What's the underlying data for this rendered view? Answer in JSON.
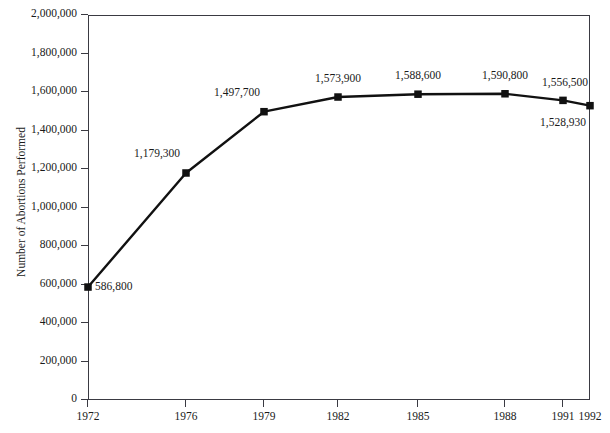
{
  "chart_data": {
    "type": "line",
    "title": "",
    "title_note": "title is cropped off the top edge of the screenshot and is unreadable",
    "xlabel": "",
    "ylabel": "Number of Abortions Performed",
    "x": [
      1972,
      1976,
      1979,
      1982,
      1985,
      1988,
      1991,
      1992
    ],
    "categories": [
      "1972",
      "1976",
      "1979",
      "1982",
      "1985",
      "1988",
      "1991",
      "1992"
    ],
    "values": [
      586800,
      1179300,
      1497700,
      1573900,
      1588600,
      1590800,
      1556500,
      1528930
    ],
    "point_labels": [
      "586,800",
      "1,179,300",
      "1,497,700",
      "1,573,900",
      "1,588,600",
      "1,590,800",
      "1,556,500",
      "1,528,930"
    ],
    "series": [
      {
        "name": "Number of Abortions Performed",
        "values": [
          586800,
          1179300,
          1497700,
          1573900,
          1588600,
          1590800,
          1556500,
          1528930
        ],
        "marker": "square",
        "color": "#111111"
      }
    ],
    "ylim": [
      0,
      2000000
    ],
    "ytick_values": [
      0,
      200000,
      400000,
      600000,
      800000,
      1000000,
      1200000,
      1400000,
      1600000,
      1800000,
      2000000
    ],
    "ytick_labels": [
      "0",
      "200,000",
      "400,000",
      "600,000",
      "800,000",
      "1,000,000",
      "1,200,000",
      "1,400,000",
      "1,600,000",
      "1,800,000",
      "2,000,000"
    ],
    "xtick_labels": [
      "1972",
      "1976",
      "1979",
      "1982",
      "1985",
      "1988",
      "1991",
      "1992"
    ],
    "grid": false,
    "legend": "none",
    "line_color": "#111111",
    "axis_color": "#3a3a42",
    "background": "#ffffff"
  },
  "axes": {
    "y_title": "Number of Abortions Performed"
  },
  "title_fragment": " "
}
